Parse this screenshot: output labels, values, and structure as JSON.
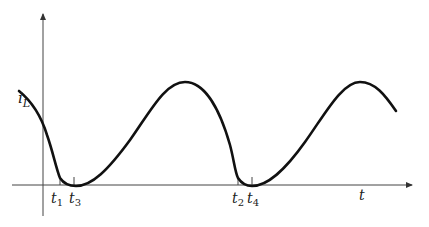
{
  "diagram": {
    "y_axis_label": {
      "main": "i",
      "sub": "L"
    },
    "x_axis_label": "t",
    "time_markers": [
      {
        "main": "t",
        "sub": "1"
      },
      {
        "main": "t",
        "sub": "3"
      },
      {
        "main": "t",
        "sub": "2"
      },
      {
        "main": "t",
        "sub": "4"
      }
    ],
    "colors": {
      "curve": "#111111",
      "axes": "#333333",
      "background": "#ffffff"
    }
  }
}
